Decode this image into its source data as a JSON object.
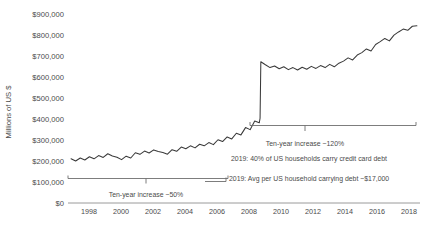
{
  "chart_data": {
    "type": "line",
    "title": "",
    "xlabel": "",
    "ylabel": "Millions of US $",
    "ylim": [
      0,
      930000
    ],
    "xlim": [
      1996.4,
      2019.4
    ],
    "grid": false,
    "legend": "none",
    "y_ticks": [
      "$0",
      "$100,000",
      "$200,000",
      "$300,000",
      "$400,000",
      "$500,000",
      "$600,000",
      "$700,000",
      "$800,000",
      "$900,000"
    ],
    "y_tick_values": [
      0,
      100000,
      200000,
      300000,
      400000,
      500000,
      600000,
      700000,
      800000,
      900000
    ],
    "x_ticks": [
      "1998",
      "2000",
      "2002",
      "2004",
      "2006",
      "2008",
      "2010",
      "2012",
      "2014",
      "2016",
      "2018"
    ],
    "x_tick_values": [
      1998,
      2000,
      2002,
      2004,
      2006,
      2008,
      2010,
      2012,
      2014,
      2016,
      2018
    ],
    "series": [
      {
        "name": "Revolving consumer credit outstanding",
        "x": [
          1996.6,
          1996.9,
          1997.2,
          1997.5,
          1997.8,
          1998.1,
          1998.4,
          1998.7,
          1999.0,
          1999.3,
          1999.6,
          1999.9,
          2000.2,
          2000.5,
          2000.8,
          2001.1,
          2001.4,
          2001.7,
          2002.0,
          2002.3,
          2002.6,
          2002.9,
          2003.2,
          2003.5,
          2003.8,
          2004.1,
          2004.4,
          2004.7,
          2005.0,
          2005.3,
          2005.6,
          2005.9,
          2006.2,
          2006.5,
          2006.8,
          2007.1,
          2007.4,
          2007.7,
          2008.0,
          2008.3,
          2008.6,
          2008.9,
          2008.95,
          2009.0,
          2009.3,
          2009.6,
          2009.9,
          2010.2,
          2010.5,
          2010.8,
          2011.1,
          2011.4,
          2011.7,
          2012.0,
          2012.3,
          2012.6,
          2012.9,
          2013.2,
          2013.5,
          2013.8,
          2014.1,
          2014.4,
          2014.7,
          2015.0,
          2015.3,
          2015.6,
          2015.9,
          2016.2,
          2016.5,
          2016.8,
          2017.1,
          2017.4,
          2017.7,
          2018.0,
          2018.3,
          2018.6,
          2018.9,
          2019.2
        ],
        "y": [
          218000,
          207000,
          222000,
          212000,
          228000,
          218000,
          234000,
          225000,
          243000,
          232000,
          226000,
          214000,
          231000,
          222000,
          248000,
          240000,
          256000,
          247000,
          262000,
          254000,
          249000,
          241000,
          263000,
          255000,
          276000,
          268000,
          282000,
          272000,
          290000,
          282000,
          298000,
          288000,
          312000,
          303000,
          326000,
          316000,
          344000,
          336000,
          372000,
          362000,
          404000,
          396000,
          418000,
          697000,
          682000,
          668000,
          676000,
          662000,
          672000,
          658000,
          668000,
          656000,
          670000,
          660000,
          674000,
          664000,
          678000,
          668000,
          684000,
          672000,
          690000,
          700000,
          716000,
          706000,
          730000,
          742000,
          760000,
          750000,
          782000,
          796000,
          812000,
          800000,
          828000,
          844000,
          858000,
          852000,
          872000,
          874000
        ]
      }
    ],
    "annotations": [
      {
        "id": "early-bracket",
        "label": "Ten-year increase ~50%",
        "spans_x": [
          1996.6,
          2008.9
        ],
        "level_y": 175000
      },
      {
        "id": "late-bracket",
        "label": "Ten-year increase ~120%",
        "spans_x": [
          2009.0,
          2019.2
        ],
        "level_y": 432000
      },
      {
        "id": "households-share",
        "label": "2019: 40% of US households carry credit card debt"
      },
      {
        "id": "avg-household-debt",
        "label": "2019: Avg per US household carrying debt ~$17,000"
      }
    ],
    "colors": {
      "line": "#3a3a3a",
      "axis": "#8f8f8f",
      "annotation": "#6e6e6e",
      "text": "#4a4a4a",
      "background": "#ffffff"
    }
  }
}
